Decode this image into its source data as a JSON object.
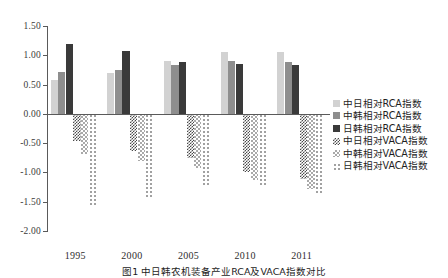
{
  "chart_data": {
    "type": "bar",
    "title": "",
    "xlabel": "",
    "ylabel": "",
    "categories": [
      "1995",
      "2000",
      "2005",
      "2010",
      "2011"
    ],
    "ylim": [
      -2.0,
      1.5
    ],
    "ytick_labels": [
      "1.50",
      "1.00",
      "0.50",
      "0.00",
      "-0.50",
      "-1.00",
      "-1.50",
      "-2.00"
    ],
    "ytick_values": [
      1.5,
      1.0,
      0.5,
      0.0,
      -0.5,
      -1.0,
      -1.5,
      -2.0
    ],
    "grid": false,
    "legend_position": "right",
    "series": [
      {
        "name": "中日相对RCA指数",
        "pattern": "light-gray-solid",
        "values": [
          0.58,
          0.69,
          0.9,
          1.06,
          1.06
        ]
      },
      {
        "name": "中韩相对RCA指数",
        "pattern": "medium-gray-solid",
        "values": [
          0.71,
          0.75,
          0.84,
          0.9,
          0.88
        ]
      },
      {
        "name": "日韩相对RCA指数",
        "pattern": "black-solid",
        "values": [
          1.19,
          1.07,
          0.89,
          0.85,
          0.84
        ]
      },
      {
        "name": "中日相对VACA指数",
        "pattern": "dark-checker",
        "values": [
          -0.46,
          -0.63,
          -0.76,
          -1.0,
          -1.12
        ]
      },
      {
        "name": "中韩相对VACA指数",
        "pattern": "light-checker",
        "values": [
          -0.69,
          -0.8,
          -0.92,
          -1.13,
          -1.29
        ]
      },
      {
        "name": "日韩相对VACA指数",
        "pattern": "sparse-dots",
        "values": [
          -1.55,
          -1.45,
          -1.24,
          -1.22,
          -1.39
        ]
      }
    ]
  },
  "caption": {
    "text": "图1  中日韩农机装备产业RCA及VACA指数对比"
  },
  "colors": {
    "series_1": "#d2d2d2",
    "series_2": "#8e8e8e",
    "series_3": "#3a3a3a",
    "series_4": "#4a4a4a",
    "series_5": "#a9a9a9",
    "series_6": "#9a9a9a",
    "axis": "#5a5a5a"
  }
}
